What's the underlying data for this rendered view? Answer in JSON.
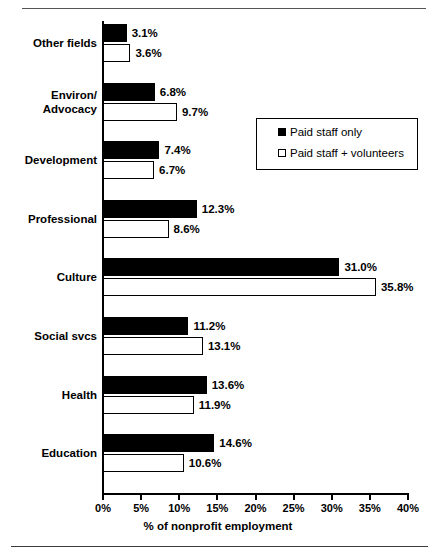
{
  "chart_data": {
    "type": "bar",
    "orientation": "horizontal",
    "title": "",
    "xlabel": "% of nonprofit employment",
    "ylabel": "",
    "xlim": [
      0,
      40
    ],
    "xticks": [
      "0%",
      "5%",
      "10%",
      "15%",
      "20%",
      "25%",
      "30%",
      "35%",
      "40%"
    ],
    "xtick_values": [
      0,
      5,
      10,
      15,
      20,
      25,
      30,
      35,
      40
    ],
    "grid": false,
    "legend_position": "upper right inside plot",
    "categories": [
      "Other fields",
      "Environ/\nAdvocacy",
      "Development",
      "Professional",
      "Culture",
      "Social svcs",
      "Health",
      "Education"
    ],
    "category_lines": [
      [
        "Other fields"
      ],
      [
        "Environ/",
        "Advocacy"
      ],
      [
        "Development"
      ],
      [
        "Professional"
      ],
      [
        "Culture"
      ],
      [
        "Social svcs"
      ],
      [
        "Health"
      ],
      [
        "Education"
      ]
    ],
    "series": [
      {
        "name": "Paid staff only",
        "style": "filled-black",
        "values": [
          3.1,
          6.8,
          7.4,
          12.3,
          31.0,
          11.2,
          13.6,
          14.6
        ],
        "labels": [
          "3.1%",
          "6.8%",
          "7.4%",
          "12.3%",
          "31.0%",
          "11.2%",
          "13.6%",
          "14.6%"
        ]
      },
      {
        "name": "Paid staff + volunteers",
        "style": "hollow-white",
        "values": [
          3.6,
          9.7,
          6.7,
          8.6,
          35.8,
          13.1,
          11.9,
          10.6
        ],
        "labels": [
          "3.6%",
          "9.7%",
          "6.7%",
          "8.6%",
          "35.8%",
          "13.1%",
          "11.9%",
          "10.6%"
        ]
      }
    ]
  },
  "legend": {
    "entries": [
      {
        "label": "Paid staff only",
        "marker": "filled-square-icon"
      },
      {
        "label": "Paid staff + volunteers",
        "marker": "hollow-square-icon"
      }
    ]
  },
  "colors": {
    "series_paid": "#000000",
    "series_both": "#ffffff",
    "outline": "#000000",
    "background": "#ffffff",
    "rule": "#55555a"
  }
}
